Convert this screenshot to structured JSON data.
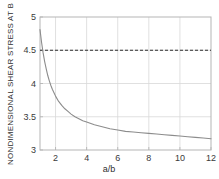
{
  "chart_data": {
    "type": "line",
    "title": "",
    "xlabel": "a/b",
    "ylabel": "NONDIMENSIONAL SHEAR STRESS AT B",
    "xlim": [
      1,
      12
    ],
    "ylim": [
      3,
      5
    ],
    "xticks": [
      2,
      4,
      6,
      8,
      10,
      12
    ],
    "yticks": [
      3,
      3.5,
      4,
      4.5,
      5
    ],
    "xtick_labels": [
      "2",
      "4",
      "6",
      "8",
      "10",
      "12"
    ],
    "ytick_labels": [
      "3",
      "3.5",
      "4",
      "4.5",
      "5"
    ],
    "grid": true,
    "legend": "none",
    "series": [
      {
        "name": "shear-stress-curve",
        "style": "solid",
        "color": "#8c8c8c",
        "x": [
          1.0,
          1.1,
          1.2,
          1.3,
          1.4,
          1.5,
          1.6,
          1.7,
          1.8,
          1.9,
          2.0,
          2.2,
          2.4,
          2.6,
          2.8,
          3.0,
          3.25,
          3.5,
          3.75,
          4.0,
          4.5,
          5.0,
          5.5,
          6.0,
          6.5,
          7.0,
          7.5,
          8.0,
          8.5,
          9.0,
          9.5,
          10.0,
          10.5,
          11.0,
          11.5,
          12.0
        ],
        "y": [
          4.81,
          4.62,
          4.46,
          4.33,
          4.22,
          4.12,
          4.04,
          3.97,
          3.91,
          3.86,
          3.81,
          3.73,
          3.67,
          3.62,
          3.58,
          3.54,
          3.5,
          3.47,
          3.44,
          3.42,
          3.38,
          3.35,
          3.32,
          3.3,
          3.28,
          3.27,
          3.26,
          3.25,
          3.24,
          3.23,
          3.22,
          3.21,
          3.2,
          3.19,
          3.18,
          3.17
        ]
      },
      {
        "name": "asymptote-reference-line",
        "style": "dashed",
        "color": "#2e2e2e",
        "value": 4.5,
        "x": [
          1,
          12
        ],
        "y": [
          4.5,
          4.5
        ]
      }
    ]
  },
  "axes": {
    "x_axis_label": "a/b",
    "y_axis_label": "NONDIMENSIONAL SHEAR STRESS AT B"
  },
  "colors": {
    "curve": "#8c8c8c",
    "dashed_line": "#2e2e2e",
    "grid": "#d8d8d8",
    "frame": "#b5b5b5",
    "text": "#2e2e2e",
    "background": "#ffffff"
  }
}
